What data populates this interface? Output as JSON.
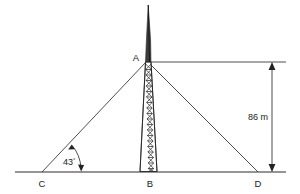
{
  "figure": {
    "points": {
      "apex": "A",
      "left_base": "C",
      "tower_base": "B",
      "right_base": "D"
    },
    "angle": {
      "value": "43",
      "degree_symbol": "°",
      "label": "43°",
      "at_point": "C"
    },
    "dimension": {
      "label": "86 m",
      "value": "86",
      "unit": "m",
      "measures": "A to D-baseline vertical height"
    },
    "objects": {
      "tower": "lattice-tower",
      "spire": "antenna-spire",
      "ground": "ground-line"
    },
    "colors": {
      "line": "#2b2b2b",
      "text": "#1a1a1a",
      "background": "#ffffff",
      "lattice": "#232323"
    }
  }
}
